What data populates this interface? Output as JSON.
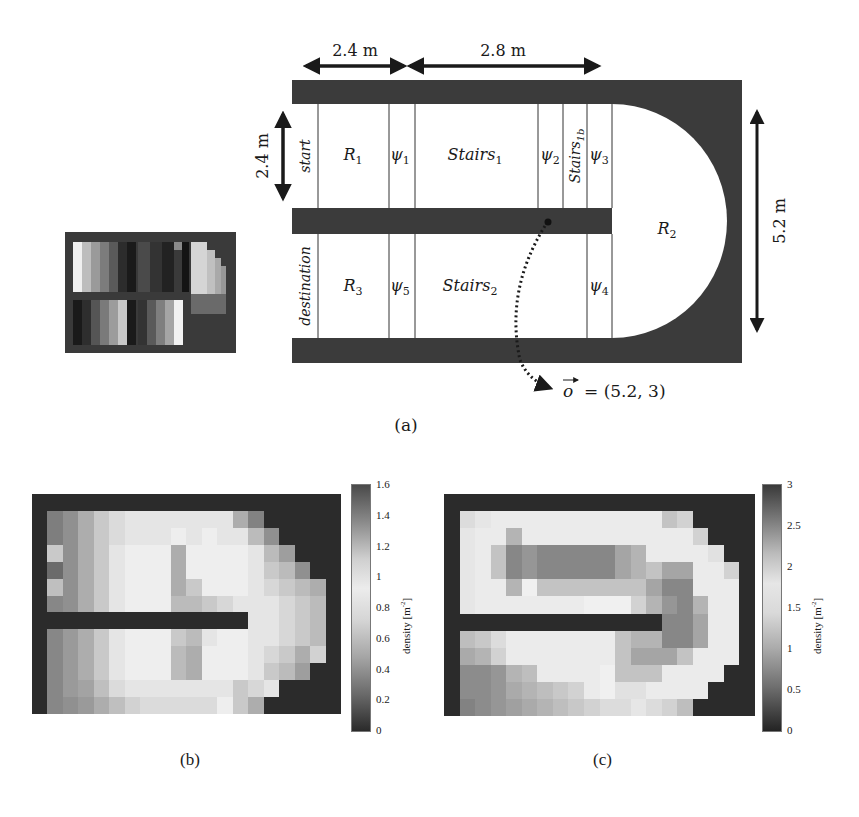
{
  "figure": {
    "panel_a": {
      "caption": "(a)",
      "dimensions": {
        "top_left": "2.4 m",
        "top_right": "2.8 m",
        "left_height": "2.4 m",
        "right_height": "5.2 m"
      },
      "regions_top": [
        "start",
        "R1",
        "ψ1",
        "Stairs1",
        "ψ2",
        "Stairs1b",
        "ψ3"
      ],
      "regions_bottom": [
        "destination",
        "R3",
        "ψ5",
        "Stairs2",
        "ψ4"
      ],
      "labels": {
        "start": "start",
        "R1": "R",
        "R1_sub": "1",
        "psi1": "ψ",
        "psi1_sub": "1",
        "stairs1": "Stairs",
        "stairs1_sub": "1",
        "psi2": "ψ",
        "psi2_sub": "2",
        "stairs1b": "Stairs",
        "stairs1b_sub": "1b",
        "psi3": "ψ",
        "psi3_sub": "3",
        "R2": "R",
        "R2_sub": "2",
        "destination": "destination",
        "R3": "R",
        "R3_sub": "3",
        "psi5": "ψ",
        "psi5_sub": "5",
        "stairs2": "Stairs",
        "stairs2_sub": "2",
        "psi4": "ψ",
        "psi4_sub": "4"
      },
      "observer": {
        "symbol": "o",
        "value": "= (5.2, 3)"
      }
    },
    "panel_b": {
      "caption": "(b)",
      "colorbar_label": "density [m",
      "colorbar_sup": "-2",
      "colorbar_close": "]",
      "ticks": [
        "1.6",
        "1.4",
        "1.2",
        "1",
        "0.8",
        "0.6",
        "0.4",
        "0.2",
        "0"
      ]
    },
    "panel_c": {
      "caption": "(c)",
      "colorbar_label": "density [m",
      "colorbar_sup": "-2",
      "colorbar_close": "]",
      "ticks": [
        "3",
        "2.5",
        "2",
        "1.5",
        "1",
        "0.5",
        "0"
      ]
    }
  },
  "chart_data": [
    {
      "type": "heatmap",
      "title": "(b)",
      "colorbar_label": "density [m^-2]",
      "vmin": 0,
      "vmax": 1.6,
      "colormap": "grayscale, dark at 0 and at max, light around 0.8-1.0",
      "grid": {
        "cols": 20,
        "rows": 13
      },
      "rows": [
        [
          0,
          0,
          0,
          0,
          0,
          0,
          0,
          0,
          0,
          0,
          0,
          0,
          0,
          0,
          0,
          0,
          0,
          0,
          0,
          0
        ],
        [
          0,
          0.35,
          0.45,
          0.6,
          0.75,
          0.85,
          0.9,
          0.9,
          0.9,
          0.9,
          0.9,
          0.9,
          0.9,
          1.2,
          1.35,
          0,
          0,
          0,
          0,
          0
        ],
        [
          0,
          0.35,
          0.45,
          0.6,
          0.75,
          0.85,
          0.9,
          0.9,
          0.9,
          0.95,
          1.0,
          0.95,
          0.9,
          1.0,
          1.15,
          1.3,
          0,
          0,
          0,
          0
        ],
        [
          0,
          0.75,
          0.45,
          0.6,
          0.75,
          0.9,
          0.95,
          0.95,
          0.95,
          1.2,
          0.95,
          0.95,
          0.95,
          0.95,
          1.0,
          1.15,
          1.25,
          0,
          0,
          0
        ],
        [
          0,
          0.25,
          0.45,
          0.6,
          0.75,
          0.9,
          0.95,
          0.95,
          0.95,
          1.2,
          0.95,
          0.95,
          0.95,
          0.95,
          1.0,
          1.1,
          1.15,
          1.3,
          0,
          0
        ],
        [
          0,
          0.7,
          0.45,
          0.6,
          0.75,
          0.9,
          0.95,
          0.95,
          0.95,
          1.2,
          1.1,
          0.95,
          0.95,
          0.95,
          1.0,
          1.05,
          1.1,
          1.15,
          1.2,
          0
        ],
        [
          0,
          0.4,
          0.45,
          0.6,
          0.75,
          0.9,
          0.95,
          0.95,
          0.95,
          1.15,
          1.15,
          1.1,
          1.05,
          1.0,
          1.0,
          1.0,
          1.05,
          1.1,
          1.15,
          0
        ],
        [
          0,
          0,
          0,
          0,
          0,
          0,
          0,
          0,
          0,
          0,
          0,
          0,
          0,
          0,
          1.0,
          1.0,
          1.05,
          1.1,
          1.15,
          0
        ],
        [
          0,
          0.4,
          0.5,
          0.6,
          0.75,
          0.9,
          0.95,
          0.95,
          0.95,
          1.1,
          1.15,
          1.0,
          0.95,
          0.95,
          1.0,
          1.0,
          1.05,
          1.1,
          1.15,
          0
        ],
        [
          0,
          0.4,
          0.5,
          0.6,
          0.75,
          0.9,
          0.95,
          0.95,
          0.95,
          1.15,
          1.2,
          0.95,
          0.95,
          0.95,
          1.0,
          1.05,
          1.1,
          1.2,
          0.8,
          0
        ],
        [
          0,
          0.4,
          0.5,
          0.6,
          0.75,
          0.9,
          0.95,
          0.95,
          0.95,
          1.15,
          1.2,
          0.95,
          0.95,
          0.95,
          1.0,
          1.1,
          1.15,
          1.25,
          0,
          0
        ],
        [
          0,
          0.4,
          0.5,
          0.55,
          0.7,
          0.85,
          0.9,
          0.9,
          0.9,
          0.9,
          0.9,
          0.9,
          0.9,
          1.1,
          1.05,
          0.9,
          0,
          0,
          0,
          0
        ],
        [
          0,
          0.4,
          0.45,
          0.5,
          0.6,
          0.7,
          0.8,
          0.85,
          0.85,
          0.85,
          0.85,
          0.85,
          0.95,
          1.1,
          1.2,
          0,
          0,
          0,
          0,
          0
        ]
      ]
    },
    {
      "type": "heatmap",
      "title": "(c)",
      "colorbar_label": "density [m^-2]",
      "vmin": 0,
      "vmax": 3,
      "colormap": "grayscale, dark at 0 and at max, light around 1.5-2.0",
      "grid": {
        "cols": 20,
        "rows": 13
      },
      "rows": [
        [
          0,
          0,
          0,
          0,
          0,
          0,
          0,
          0,
          0,
          0,
          0,
          0,
          0,
          0,
          0,
          0,
          0,
          0,
          0,
          0
        ],
        [
          0,
          1.6,
          1.7,
          1.75,
          1.75,
          1.75,
          1.75,
          1.75,
          1.75,
          1.75,
          1.75,
          1.75,
          1.75,
          1.75,
          2.1,
          2.0,
          0,
          0,
          0,
          0
        ],
        [
          0,
          1.7,
          1.75,
          1.75,
          2.2,
          1.75,
          1.75,
          1.75,
          1.75,
          1.75,
          1.75,
          1.75,
          1.75,
          1.75,
          1.75,
          1.75,
          2.0,
          0,
          0,
          0
        ],
        [
          0,
          1.7,
          1.75,
          2.1,
          2.5,
          2.4,
          2.5,
          2.5,
          2.5,
          2.5,
          2.5,
          2.3,
          2.2,
          1.75,
          1.75,
          1.75,
          1.75,
          1.9,
          0,
          0
        ],
        [
          0,
          1.7,
          1.75,
          2.1,
          2.5,
          2.4,
          2.5,
          2.5,
          2.5,
          2.5,
          2.5,
          2.3,
          2.2,
          2.1,
          2.3,
          2.3,
          1.75,
          1.75,
          2.0,
          0
        ],
        [
          0,
          1.7,
          1.75,
          1.75,
          2.2,
          1.8,
          2.1,
          2.1,
          2.1,
          2.1,
          2.1,
          2.1,
          2.1,
          2.3,
          2.5,
          2.5,
          1.75,
          1.75,
          1.75,
          0
        ],
        [
          0,
          1.7,
          1.75,
          1.75,
          1.75,
          1.75,
          1.75,
          1.75,
          1.75,
          1.8,
          1.8,
          1.8,
          2.0,
          2.2,
          2.4,
          2.5,
          2.2,
          1.75,
          1.75,
          0
        ],
        [
          0,
          0,
          0,
          0,
          0,
          0,
          0,
          0,
          0,
          0,
          0,
          0,
          0,
          0,
          2.5,
          2.5,
          2.3,
          1.75,
          1.75,
          0
        ],
        [
          0,
          1.3,
          1.4,
          1.6,
          1.75,
          1.75,
          1.75,
          1.75,
          1.75,
          1.75,
          1.75,
          2.1,
          2.2,
          2.2,
          2.5,
          2.5,
          2.3,
          1.75,
          1.75,
          0
        ],
        [
          0,
          1.1,
          1.2,
          1.5,
          1.75,
          1.75,
          1.75,
          1.75,
          1.75,
          1.75,
          1.75,
          2.1,
          2.3,
          2.3,
          2.3,
          2.1,
          1.75,
          1.75,
          1.75,
          0
        ],
        [
          0,
          0.8,
          0.8,
          0.9,
          1.2,
          1.3,
          1.75,
          1.75,
          1.75,
          1.75,
          1.8,
          2.1,
          2.1,
          2.1,
          1.75,
          1.75,
          1.75,
          1.75,
          0,
          0
        ],
        [
          0,
          0.8,
          0.8,
          0.9,
          1.1,
          1.2,
          1.3,
          1.4,
          1.5,
          1.75,
          1.8,
          1.9,
          1.9,
          1.75,
          1.75,
          1.75,
          1.75,
          0,
          0,
          0
        ],
        [
          0,
          0.7,
          0.8,
          0.9,
          1.0,
          1.1,
          1.2,
          1.3,
          1.4,
          1.5,
          1.6,
          1.6,
          1.7,
          1.6,
          1.5,
          1.3,
          0,
          0,
          0,
          0
        ]
      ]
    }
  ]
}
